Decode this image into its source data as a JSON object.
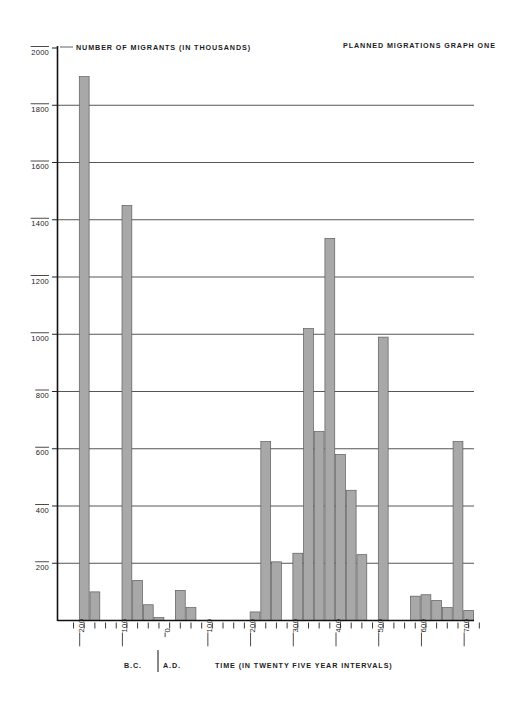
{
  "chart_data": {
    "type": "bar",
    "title": "PLANNED MIGRATIONS  GRAPH ONE",
    "ylabel": "NUMBER OF MIGRANTS (IN THOUSANDS)",
    "xlabel": "TIME (IN  TWENTY FIVE YEAR INTERVALS)",
    "era_left_label": "B.C.",
    "era_right_label": "A.D.",
    "ylim": [
      0,
      2000
    ],
    "ytick_labels": [
      "2000",
      "1800",
      "1600",
      "1400",
      "1200",
      "1000",
      "800",
      "600",
      "400",
      "200"
    ],
    "ytick_values": [
      2000,
      1800,
      1600,
      1400,
      1200,
      1000,
      800,
      600,
      400,
      200
    ],
    "grid": true,
    "legend": "none",
    "xtick_labels": [
      "200",
      "100",
      "0",
      "100",
      "200",
      "300",
      "400",
      "500",
      "600",
      "700"
    ],
    "xtick_label_years": [
      -200,
      -100,
      0,
      100,
      200,
      300,
      400,
      500,
      600,
      700
    ],
    "x_interval_years": 25,
    "xlim": [
      -250,
      725
    ],
    "categories": [
      -250,
      -225,
      -200,
      -175,
      -150,
      -125,
      -100,
      -75,
      -50,
      -25,
      0,
      25,
      50,
      75,
      100,
      125,
      150,
      175,
      200,
      225,
      250,
      275,
      300,
      325,
      350,
      375,
      400,
      425,
      450,
      475,
      500,
      525,
      550,
      575,
      600,
      625,
      650,
      675,
      700
    ],
    "values": [
      0,
      0,
      1900,
      100,
      0,
      0,
      1450,
      140,
      55,
      10,
      0,
      105,
      45,
      0,
      0,
      0,
      0,
      0,
      30,
      625,
      205,
      0,
      235,
      1020,
      660,
      1335,
      580,
      455,
      230,
      0,
      990,
      0,
      0,
      85,
      90,
      70,
      45,
      625,
      35
    ],
    "bar_fill_color": "#a8a8a8",
    "bar_edge_color": "#5d5d5d",
    "background_color": "#ffffff",
    "grid_color": "#2b2b2b"
  }
}
